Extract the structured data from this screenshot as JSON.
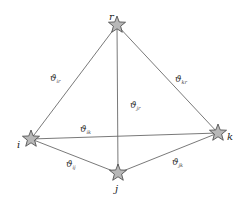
{
  "diagram": {
    "nodes": [
      {
        "id": "r",
        "label": "r",
        "x": 117,
        "y": 25,
        "lx": 109,
        "ly": 20
      },
      {
        "id": "i",
        "label": "i",
        "x": 31,
        "y": 139,
        "lx": 17,
        "ly": 148
      },
      {
        "id": "k",
        "label": "k",
        "x": 218,
        "y": 133,
        "lx": 227,
        "ly": 140
      },
      {
        "id": "j",
        "label": "j",
        "x": 118,
        "y": 173,
        "lx": 115,
        "ly": 192
      }
    ],
    "edges": [
      {
        "from": "i",
        "to": "r",
        "symbol": "ϑ",
        "sub": "ir",
        "lx": 50,
        "ly": 81
      },
      {
        "from": "k",
        "to": "r",
        "symbol": "ϑ",
        "sub": "kr",
        "lx": 175,
        "ly": 82
      },
      {
        "from": "j",
        "to": "r",
        "symbol": "ϑ",
        "sub": "jr",
        "lx": 130,
        "ly": 108
      },
      {
        "from": "i",
        "to": "k",
        "symbol": "ϑ",
        "sub": "ik",
        "lx": 80,
        "ly": 132
      },
      {
        "from": "i",
        "to": "j",
        "symbol": "ϑ",
        "sub": "ij",
        "lx": 66,
        "ly": 167
      },
      {
        "from": "j",
        "to": "k",
        "symbol": "ϑ",
        "sub": "jk",
        "lx": 172,
        "ly": 165
      }
    ],
    "colors": {
      "star_fill": "#b8b8b8",
      "star_stroke": "#444444",
      "edge": "#6a6a6a"
    }
  }
}
